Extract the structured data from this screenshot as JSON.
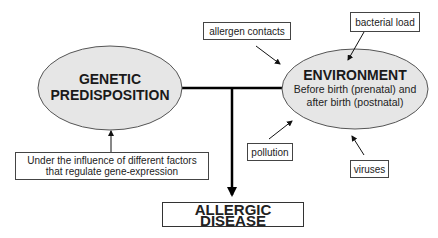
{
  "diagram": {
    "colors": {
      "ellipse_fill": "#e6e6e6",
      "ellipse_stroke": "#555555",
      "line": "#000000",
      "box_border": "#444444"
    },
    "nodes": {
      "genetic": {
        "title_line1": "GENETIC",
        "title_line2": "PREDISPOSITION"
      },
      "environment": {
        "title": "ENVIRONMENT",
        "subtitle_line1": "Before birth (prenatal) and",
        "subtitle_line2": "after birth (postnatal)"
      },
      "outcome": {
        "label": "ALLERGIC DISEASE"
      }
    },
    "factors": {
      "gene_expression": {
        "line1": "Under the influence of different factors",
        "line2": "that regulate gene-expression"
      },
      "allergen_contacts": "allergen contacts",
      "bacterial_load": "bacterial load",
      "pollution": "pollution",
      "viruses": "viruses"
    }
  }
}
